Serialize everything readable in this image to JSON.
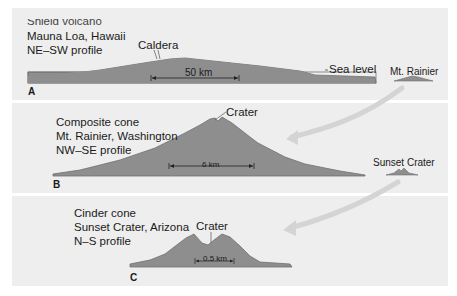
{
  "colors": {
    "panel_bg": "#eeeeee",
    "profile_fill": "#8e8e8e",
    "profile_stroke": "#6e6e6e",
    "arrow": "#d4d4d4",
    "text": "#1a1a1a"
  },
  "panels": [
    {
      "letter": "A",
      "title_lines": [
        "Shield volcano",
        "Mauna Loa, Hawaii",
        "NE–SW profile"
      ],
      "feature_label": "Caldera",
      "scale_label": "50 km",
      "side_label": "Sea level",
      "comparison_label": "Mt. Rainier"
    },
    {
      "letter": "B",
      "title_lines": [
        "Composite cone",
        "Mt. Rainier, Washington",
        "NW–SE profile"
      ],
      "feature_label": "Crater",
      "scale_label": "6 km",
      "comparison_label": "Sunset Crater"
    },
    {
      "letter": "C",
      "title_lines": [
        "Cinder cone",
        "Sunset Crater, Arizona",
        "N–S profile"
      ],
      "feature_label": "Crater",
      "scale_label": "0.5 km"
    }
  ]
}
